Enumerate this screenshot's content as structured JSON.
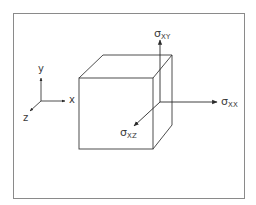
{
  "diagram": {
    "title": "",
    "frame": {
      "stroke": "#888888"
    },
    "stroke_color": "#3a3a3a",
    "coordinate_axes": {
      "x_label": "x",
      "y_label": "y",
      "z_label": "z"
    },
    "stress_components": [
      {
        "symbol": "σ",
        "subscript": "XY",
        "direction": "up"
      },
      {
        "symbol": "σ",
        "subscript": "XX",
        "direction": "right"
      },
      {
        "symbol": "σ",
        "subscript": "XZ",
        "direction": "out-of-page (diagonal down-left)"
      }
    ],
    "element": "cube"
  }
}
